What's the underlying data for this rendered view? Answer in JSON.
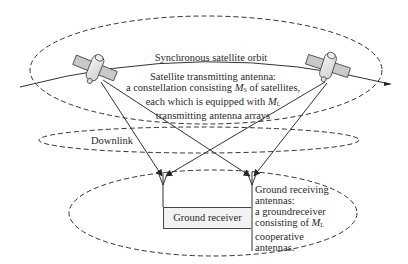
{
  "diagram": {
    "orbit": {
      "label": "Synchronous satellite orbit"
    },
    "satellite_note": {
      "line1": "Satellite transmitting antenna:",
      "line2_pre": "a constellation consisting ",
      "line2_sym": "M",
      "line2_sub": "S",
      "line2_post": " of satellites,",
      "line3_pre": "each which is equipped with ",
      "line3_sym": "M",
      "line3_sub": "L",
      "line4": "transmitting antenna arrays"
    },
    "downlink": {
      "label": "Downlink"
    },
    "ground_receiver": {
      "label": "Ground receiver"
    },
    "ground_note": {
      "line1": "Ground receiving",
      "line2": "antennas:",
      "line3": "a groundreceiver",
      "line4_pre": "consisting of  ",
      "line4_sym": "M",
      "line4_sub": "L",
      "line5": "cooperative",
      "line6": "antennas."
    },
    "nodes": [
      {
        "id": "satellite-left",
        "x": 95,
        "y": 68
      },
      {
        "id": "satellite-right",
        "x": 330,
        "y": 68
      },
      {
        "id": "antenna-left",
        "x": 163,
        "y": 183
      },
      {
        "id": "antenna-right",
        "x": 252,
        "y": 183
      }
    ],
    "edges": [
      {
        "from": "satellite-left",
        "to": "antenna-left"
      },
      {
        "from": "satellite-left",
        "to": "antenna-right"
      },
      {
        "from": "satellite-right",
        "to": "antenna-left"
      },
      {
        "from": "satellite-right",
        "to": "antenna-right"
      }
    ],
    "colors": {
      "line": "#333333",
      "satellite_panel": "#c9c9c9",
      "satellite_body": "#e4e4e4",
      "receiver_fill": "#f2f2f2"
    }
  }
}
